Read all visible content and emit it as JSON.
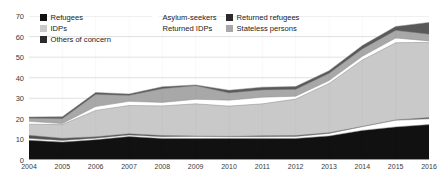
{
  "chart_data": {
    "type": "area",
    "title": "",
    "subtitle": "",
    "xlabel": "",
    "ylabel": "",
    "stacked": true,
    "grid": true,
    "legend_position": "top-left",
    "x": [
      2004,
      2005,
      2006,
      2007,
      2008,
      2009,
      2010,
      2011,
      2012,
      2013,
      2014,
      2015,
      2016
    ],
    "xlim": [
      2004,
      2016
    ],
    "ylim": [
      0,
      70
    ],
    "yticks": [
      0,
      10,
      20,
      30,
      40,
      50,
      60,
      70
    ],
    "xticks": [
      "2004",
      "2005",
      "2006",
      "2007",
      "2008",
      "2009",
      "2010",
      "2011",
      "2012",
      "2013",
      "2014",
      "2015",
      "2016"
    ],
    "series": [
      {
        "name": "Refugees",
        "color": "#111111",
        "values": [
          9.6,
          8.7,
          9.9,
          11.4,
          10.5,
          10.4,
          10.5,
          10.4,
          10.5,
          11.7,
          14.4,
          16.1,
          17.2
        ]
      },
      {
        "name": "Asylum-seekers",
        "color": "#ffffff",
        "values": [
          0.9,
          0.8,
          0.7,
          0.7,
          0.8,
          1.0,
          0.8,
          0.9,
          0.9,
          1.2,
          1.8,
          3.2,
          2.8
        ]
      },
      {
        "name": "Returned refugees",
        "color": "#4f4f4f",
        "values": [
          1.5,
          1.1,
          0.7,
          0.7,
          0.6,
          0.3,
          0.2,
          0.5,
          0.5,
          0.4,
          0.1,
          0.2,
          0.6
        ]
      },
      {
        "name": "IDPs",
        "color": "#c9c9c9",
        "values": [
          5.4,
          6.6,
          12.8,
          13.7,
          14.4,
          15.6,
          14.7,
          15.5,
          17.7,
          23.9,
          32.3,
          37.5,
          36.6
        ]
      },
      {
        "name": "Returned IDPs",
        "color": "#ffffff",
        "values": [
          1.4,
          0.5,
          1.9,
          2.0,
          1.7,
          2.2,
          2.9,
          3.2,
          1.4,
          1.4,
          1.8,
          2.3,
          0.7
        ]
      },
      {
        "name": "Stateless persons",
        "color": "#a8a8a8",
        "values": [
          1.5,
          2.4,
          5.8,
          2.9,
          6.6,
          6.6,
          3.5,
          3.5,
          3.3,
          3.5,
          3.5,
          3.7,
          3.2
        ]
      },
      {
        "name": "Others of concern",
        "color": "#595959",
        "values": [
          0.6,
          0.9,
          1.0,
          0.7,
          1.0,
          0.4,
          1.3,
          1.4,
          1.4,
          1.3,
          1.7,
          1.9,
          5.8
        ]
      }
    ],
    "totals": [
      20.9,
      21.0,
      32.8,
      32.1,
      35.6,
      36.5,
      33.9,
      35.4,
      35.7,
      43.4,
      55.6,
      64.9,
      67.0
    ]
  },
  "legend": {
    "columns": [
      {
        "items": [
          {
            "label": "Refugees",
            "swatch": "#111111",
            "swatch_border": "#111111"
          },
          {
            "label": "IDPs",
            "swatch": "#c9c9c9",
            "swatch_border": "#c9c9c9"
          },
          {
            "label": "Others of concern",
            "swatch": "#2b2b2b",
            "swatch_border": "#2b2b2b"
          }
        ]
      },
      {
        "items": [
          {
            "label": "Asylum-seekers",
            "swatch": "#ffffff",
            "swatch_border": "#ffffff"
          },
          {
            "label": "Returned IDPs",
            "swatch": "#ffffff",
            "swatch_border": "#ffffff"
          }
        ]
      },
      {
        "items": [
          {
            "label": "Returned refugees",
            "swatch": "#2b2b2b",
            "swatch_border": "#2b2b2b"
          },
          {
            "label": "Stateless persons",
            "swatch": "#a8a8a8",
            "swatch_border": "#a8a8a8"
          }
        ]
      }
    ]
  },
  "axes": {
    "y_tick_labels": [
      "70",
      "60",
      "50",
      "40",
      "30",
      "20",
      "10",
      "0"
    ],
    "x_tick_labels": [
      "2004",
      "2005",
      "2006",
      "2007",
      "2008",
      "2009",
      "2010",
      "2011",
      "2012",
      "2013",
      "2014",
      "2015",
      "2016"
    ]
  },
  "style": {
    "gridline_color": "#d9d9d9",
    "axis_color": "#9a9a9a",
    "tick_text_color": "#3a3a3a",
    "plot_background": "#ffffff"
  }
}
